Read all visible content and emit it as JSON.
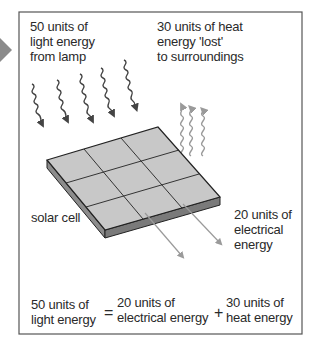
{
  "figure": {
    "type": "energy-transfer-diagram",
    "colors": {
      "frame": "#555555",
      "pointer_arrow": "#8a8a8a",
      "light_wave": "#444444",
      "heat_wave": "#9a9a9a",
      "panel_top": "#c8c8c8",
      "panel_side": "#8c8c8c",
      "electric_arrow": "#9a9a9a"
    },
    "labels": {
      "light_in": [
        "50 units of",
        "light energy",
        "from lamp"
      ],
      "heat_out": [
        "30 units of heat",
        "energy 'lost'",
        "to surroundings"
      ],
      "solar_cell": "solar cell",
      "electric_out": [
        "20 units of",
        "electrical",
        "energy"
      ]
    },
    "equation": {
      "lhs": [
        "50 units of",
        "light energy"
      ],
      "eq_sign": "=",
      "term1": [
        "20 units of",
        "electrical energy"
      ],
      "plus_sign": "+",
      "term2": [
        "30 units of",
        "heat energy"
      ]
    }
  }
}
